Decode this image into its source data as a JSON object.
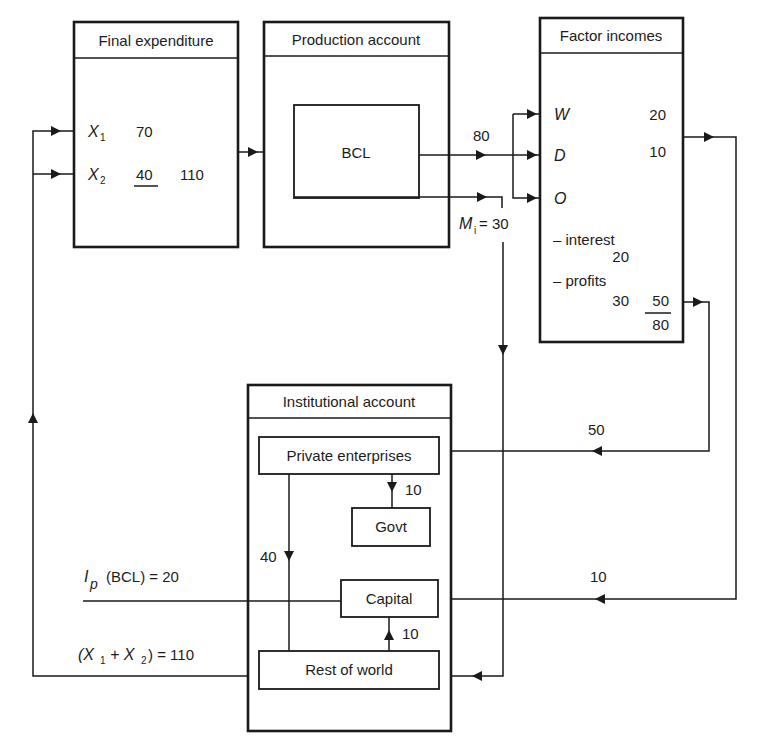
{
  "diagram": {
    "final_expenditure": {
      "title": "Final expenditure",
      "x1_label": "X",
      "x1_sub": "1",
      "x1_value": "70",
      "x2_label": "X",
      "x2_sub": "2",
      "x2_value": "40",
      "total": "110"
    },
    "production_account": {
      "title": "Production account",
      "inner_box": "BCL",
      "output_flow": "80",
      "imports_label": "M",
      "imports_sub": "i",
      "imports_value": "= 30"
    },
    "factor_incomes": {
      "title": "Factor incomes",
      "w_label": "W",
      "w_value": "20",
      "d_label": "D",
      "d_value": "10",
      "o_label": "O",
      "interest_label": "– interest",
      "interest_value": "20",
      "profits_label": "– profits",
      "profits_value": "30",
      "o_total": "50",
      "grand_total": "80"
    },
    "institutional_account": {
      "title": "Institutional account",
      "private_enterprises": "Private enterprises",
      "govt": "Govt",
      "capital": "Capital",
      "rest_of_world": "Rest of world",
      "pe_to_govt": "10",
      "pe_to_row": "40",
      "row_to_capital": "10"
    },
    "flows": {
      "to_private_enterprises": "50",
      "to_capital": "10",
      "investment_label": "I",
      "investment_sub": "p",
      "investment_text": "(BCL) = 20",
      "exports_text_open": "(X",
      "exports_sub1": "1",
      "exports_plus": "+ X",
      "exports_sub2": "2",
      "exports_text_close": ") = 110"
    }
  }
}
